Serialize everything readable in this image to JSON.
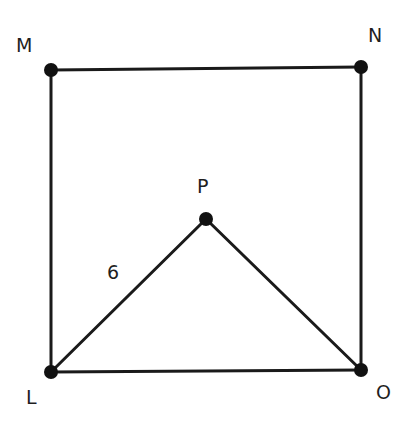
{
  "figure": {
    "type": "geometry",
    "vertices": {
      "M": {
        "label": "M",
        "x": 51,
        "y": 70
      },
      "N": {
        "label": "N",
        "x": 361,
        "y": 67
      },
      "O": {
        "label": "O",
        "x": 361,
        "y": 370
      },
      "L": {
        "label": "L",
        "x": 51,
        "y": 372
      },
      "P": {
        "label": "P",
        "x": 206,
        "y": 219
      }
    },
    "edges": [
      {
        "from": "M",
        "to": "N"
      },
      {
        "from": "N",
        "to": "O"
      },
      {
        "from": "O",
        "to": "L"
      },
      {
        "from": "L",
        "to": "M"
      },
      {
        "from": "L",
        "to": "P"
      },
      {
        "from": "P",
        "to": "O"
      }
    ],
    "edge_labels": {
      "LP": "6"
    },
    "colors": {
      "stroke": "#1a1a1a",
      "vertex": "#111111",
      "text": "#1f1f1f",
      "background": "#ffffff"
    }
  }
}
